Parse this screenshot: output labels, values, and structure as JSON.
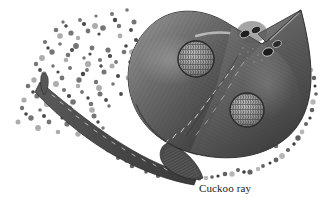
{
  "figure": {
    "caption": "Cuckoo ray",
    "subject_name": "cuckoo-ray",
    "medium": "grayscale stipple and line engraving",
    "background_color": "#ffffff",
    "body_colors": {
      "body_dark": "#3d3d3d",
      "body_mid": "#5e5e5e",
      "body_light": "#8c8c8c",
      "body_highlight": "#cfcfcf",
      "outline": "#2a2a2a",
      "gravel_dark": "#4a4a4a",
      "gravel_mid": "#7d7d7d",
      "gravel_light": "#aeaeae",
      "caption_color": "#1a1a1a"
    },
    "parts": [
      {
        "name": "left-pectoral-wing",
        "label": "Left pectoral wing"
      },
      {
        "name": "right-pectoral-wing",
        "label": "Right pectoral wing"
      },
      {
        "name": "snout",
        "label": "Pointed snout"
      },
      {
        "name": "eye-left",
        "label": "Eye"
      },
      {
        "name": "eye-right",
        "label": "Eye"
      },
      {
        "name": "spiracle-left",
        "label": "Spiracle"
      },
      {
        "name": "spiracle-right",
        "label": "Spiracle"
      },
      {
        "name": "ocellus-upper",
        "label": "Upper ocellus eyespot"
      },
      {
        "name": "ocellus-lower",
        "label": "Lower ocellus eyespot"
      },
      {
        "name": "thorn-row",
        "label": "Median row of thorns"
      },
      {
        "name": "tail",
        "label": "Tail"
      },
      {
        "name": "tail-dorsal-fin",
        "label": "Tail dorsal fin"
      },
      {
        "name": "pelvic-fin",
        "label": "Pelvic fin"
      },
      {
        "name": "gravel-seabed",
        "label": "Gravel seabed"
      }
    ]
  }
}
